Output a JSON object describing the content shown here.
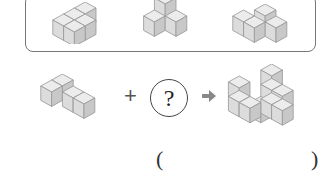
{
  "problem": {
    "choices": [
      {
        "id": "choice-1",
        "description": "2x2 flat block of 4 cubes"
      },
      {
        "id": "choice-2",
        "description": "3 cubes in L with 1 cube stacked on top"
      },
      {
        "id": "choice-3",
        "description": "4 cubes zig-zag shape"
      }
    ],
    "equation": {
      "given_shape": "L-shaped block of 4 cubes",
      "operator": "+",
      "unknown": "?",
      "result_shape": "combined block of cubes"
    },
    "answer": {
      "open_paren": "(",
      "close_paren": ")",
      "value": ""
    }
  },
  "colors": {
    "cube_top": "#e8e8e8",
    "cube_left": "#d6d6d6",
    "cube_right": "#c4c4c4",
    "cube_edge": "#9a9a9a",
    "arrow": "#888888",
    "box_border": "#777777"
  }
}
